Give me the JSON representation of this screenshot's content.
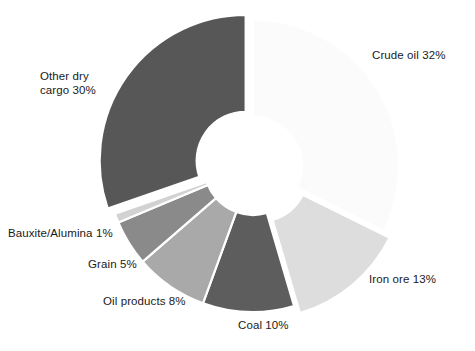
{
  "chart_data": {
    "type": "pie",
    "variant": "donut",
    "title": "",
    "subtitle": "",
    "xlabel": "",
    "ylabel": "",
    "legend_position": "none",
    "grid": false,
    "units": "percent",
    "total": 99,
    "categories": [
      "Crude oil",
      "Iron ore",
      "Coal",
      "Oil products",
      "Grain",
      "Bauxite/Alumina",
      "Other dry cargo"
    ],
    "values": [
      32,
      13,
      10,
      8,
      5,
      1,
      30
    ],
    "labels": [
      "Crude oil 32%",
      "Iron ore 13%",
      "Coal 10%",
      "Oil products 8%",
      "Grain 5%",
      "Bauxite/Alumina 1%",
      "Other dry cargo 30%"
    ],
    "label_multiline": {
      "other_dry_cargo": "Other dry\ncargo 30%"
    },
    "slice_colors": [
      "#fbfbfb",
      "#dddddd",
      "#5d5d5d",
      "#a9a9a9",
      "#8a8a8a",
      "#d2d2d2",
      "#575757"
    ],
    "exploded": [
      false,
      true,
      false,
      false,
      false,
      false,
      true
    ],
    "start_angle_deg": 0,
    "direction": "clockwise",
    "geometry": {
      "center_x": 253,
      "center_y": 166,
      "outer_radius": 146,
      "inner_radius": 49,
      "explode_offset": 9,
      "separator_color": "#ffffff",
      "separator_width": 2.2
    }
  },
  "labels": {
    "crude_oil": "Crude oil 32%",
    "iron_ore": "Iron ore 13%",
    "coal": "Coal 10%",
    "oil_products": "Oil products 8%",
    "grain": "Grain 5%",
    "bauxite_alumina": "Bauxite/Alumina 1%",
    "other_dry_cargo_line1": "Other dry",
    "other_dry_cargo_line2": "cargo 30%"
  }
}
